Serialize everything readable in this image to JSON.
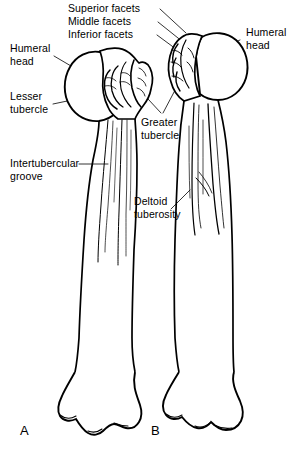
{
  "figure": {
    "background_color": "#ffffff",
    "ink_color": "#000000",
    "width": 304,
    "height": 452
  },
  "labels": {
    "superior_facets": "Superior facets",
    "middle_facets": "Middle facets",
    "inferior_facets": "Inferior facets",
    "humeral_head_left": "Humeral\nhead",
    "humeral_head_right": "Humeral\nhead",
    "lesser_tubercle": "Lesser\ntubercle",
    "greater_tubercle": "Greater\ntubercle",
    "intertubercular_groove": "Intertubercular\ngroove",
    "deltoid_tuberosity": "Deltoid\ntuberosity"
  },
  "panels": {
    "a": "A",
    "b": "B"
  }
}
